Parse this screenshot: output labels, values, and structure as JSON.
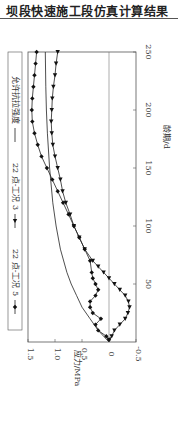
{
  "header": {
    "title": "坝段快速施工段仿真计算结果"
  },
  "chart_data": {
    "type": "line",
    "orientation": "rotated-90",
    "title": "",
    "xlabel": "龄期/d",
    "ylabel": "应力/MPa",
    "xlim": [
      0,
      250
    ],
    "ylim": [
      -0.5,
      1.5
    ],
    "xticks": [
      "50",
      "100",
      "150",
      "200",
      "250"
    ],
    "yticks": [
      "-0.5",
      "0",
      "0.5",
      "1.0",
      "1.5"
    ],
    "legend": [
      {
        "label": "22 点-工况 5",
        "marker": "diamond"
      },
      {
        "label": "22 点-工况 3",
        "marker": "triangle"
      },
      {
        "label": "允许抗拉强度",
        "marker": "none"
      }
    ],
    "series": [
      {
        "name": "22 点-工况 5",
        "x": [
          2,
          5,
          10,
          15,
          20,
          25,
          30,
          35,
          40,
          45,
          50,
          55,
          60,
          70,
          80,
          90,
          100,
          110,
          120,
          130,
          140,
          150,
          160,
          170,
          180,
          190,
          200,
          210,
          220,
          230,
          240,
          250
        ],
        "values": [
          0.0,
          0.05,
          0.2,
          0.25,
          0.15,
          0.3,
          0.35,
          0.35,
          0.25,
          0.2,
          0.25,
          0.3,
          0.32,
          0.35,
          0.45,
          0.55,
          0.65,
          0.75,
          0.85,
          0.95,
          1.05,
          1.15,
          1.25,
          1.32,
          1.38,
          1.42,
          1.43,
          1.42,
          1.4,
          1.38,
          1.36,
          1.34
        ]
      },
      {
        "name": "22 点-工况 3",
        "x": [
          2,
          5,
          10,
          15,
          20,
          25,
          30,
          35,
          40,
          45,
          50,
          55,
          60,
          65,
          70,
          80,
          90,
          100,
          110,
          120,
          130,
          140,
          150,
          160,
          170,
          180,
          190,
          200,
          210,
          220,
          230,
          240,
          250
        ],
        "values": [
          0.0,
          -0.05,
          -0.1,
          -0.2,
          -0.3,
          -0.35,
          -0.38,
          -0.36,
          -0.3,
          -0.2,
          -0.1,
          0.0,
          0.1,
          0.2,
          0.3,
          0.45,
          0.55,
          0.65,
          0.72,
          0.8,
          0.86,
          0.9,
          0.95,
          1.0,
          1.04,
          1.06,
          1.07,
          1.06,
          1.05,
          1.03,
          1.0,
          0.98,
          0.95
        ]
      },
      {
        "name": "允许抗拉强度",
        "x": [
          0,
          5,
          10,
          20,
          30,
          40,
          50,
          60,
          80,
          100,
          120,
          150,
          180,
          200,
          220,
          250
        ],
        "values": [
          0.0,
          0.1,
          0.2,
          0.35,
          0.5,
          0.6,
          0.7,
          0.78,
          0.9,
          0.98,
          1.04,
          1.1,
          1.14,
          1.16,
          1.17,
          1.18
        ]
      }
    ],
    "grid": false,
    "legend_position": "top"
  }
}
